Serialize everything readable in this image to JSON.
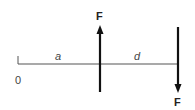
{
  "diagram": {
    "type": "force couple on beam",
    "origin_label": "0",
    "segment_labels": [
      "a",
      "d"
    ],
    "forces": [
      {
        "label": "F",
        "direction": "up",
        "position": "a"
      },
      {
        "label": "F",
        "direction": "down",
        "position": "a + d"
      }
    ],
    "colors": {
      "line": "#555555",
      "arrow": "#111111",
      "text": "#222222"
    }
  }
}
